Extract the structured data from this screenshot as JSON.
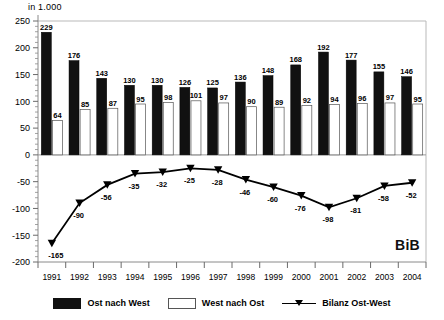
{
  "chart_data": {
    "type": "bar",
    "title": "",
    "ylabel": "in 1.000",
    "xlabel": "",
    "ylim": [
      -200,
      250
    ],
    "ytick_step": 50,
    "grid": false,
    "legend_position": "bottom",
    "categories": [
      "1991",
      "1992",
      "1993",
      "1994",
      "1995",
      "1996",
      "1997",
      "1998",
      "1999",
      "2000",
      "2001",
      "2002",
      "2003",
      "2004"
    ],
    "series": [
      {
        "name": "Ost nach West",
        "type": "bar",
        "color": "#111111",
        "values": [
          229,
          176,
          143,
          130,
          130,
          126,
          125,
          136,
          148,
          168,
          192,
          177,
          155,
          146
        ]
      },
      {
        "name": "West nach Ost",
        "type": "bar",
        "color": "#ffffff",
        "values": [
          64,
          85,
          87,
          95,
          98,
          101,
          97,
          90,
          89,
          92,
          94,
          96,
          97,
          95
        ]
      },
      {
        "name": "Bilanz Ost-West",
        "type": "line",
        "color": "#000000",
        "values": [
          -165,
          -90,
          -56,
          -35,
          -32,
          -25,
          -28,
          -46,
          -60,
          -76,
          -98,
          -81,
          -58,
          -52
        ]
      }
    ],
    "ytick_labels": [
      "250",
      "200",
      "150",
      "100",
      "50",
      "0",
      "-50",
      "-100",
      "-150",
      "-200"
    ],
    "annotations": [
      {
        "name": "watermark",
        "text": "BiB"
      }
    ]
  },
  "legend": {
    "items": [
      {
        "label": "Ost nach West",
        "marker": "black-square"
      },
      {
        "label": "West nach Ost",
        "marker": "white-square"
      },
      {
        "label": "Bilanz Ost-West",
        "marker": "line-triangle"
      }
    ]
  }
}
